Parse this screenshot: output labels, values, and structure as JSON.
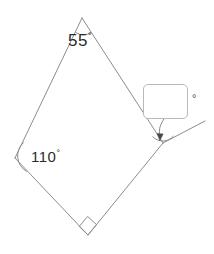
{
  "diagram": {
    "background_color": "#ffffff",
    "stroke_color": "#8c8c8c",
    "label_color": "#2b2b2b",
    "shape": "quadrilateral",
    "vertices": {
      "apex": {
        "name": "top-vertex",
        "x": 82,
        "y": 18
      },
      "left": {
        "name": "left-vertex",
        "x": 15,
        "y": 158
      },
      "bottom": {
        "name": "bottom-vertex",
        "x": 88,
        "y": 235
      },
      "right": {
        "name": "right-vertex",
        "x": 163,
        "y": 143
      }
    },
    "exterior_ray": {
      "name": "extended-ray",
      "from_x": 163,
      "from_y": 143,
      "to_x": 205,
      "to_y": 121
    },
    "angles": [
      {
        "name": "apex-angle",
        "at": "top-vertex",
        "value": "55",
        "degree_symbol": "°",
        "marker": "arc",
        "label_x": 68,
        "label_y": 32
      },
      {
        "name": "left-angle",
        "at": "left-vertex",
        "value": "110",
        "degree_symbol": "°",
        "marker": "arc",
        "label_x": 31,
        "label_y": 149
      },
      {
        "name": "bottom-angle",
        "at": "bottom-vertex",
        "value": "",
        "degree_symbol": "",
        "marker": "right-angle-square",
        "label_x": 0,
        "label_y": 0
      },
      {
        "name": "exterior-angle-unknown",
        "at": "right-vertex",
        "value": "",
        "degree_symbol": "°",
        "marker": "arc",
        "label_x": 0,
        "label_y": 0
      }
    ]
  },
  "answer": {
    "box_value": "",
    "box_placeholder": "",
    "degree_symbol": "°",
    "leader": {
      "name": "leader-line",
      "from_x": 163,
      "from_y": 119,
      "to_x": 160,
      "to_y": 137,
      "arrowhead": true
    }
  }
}
